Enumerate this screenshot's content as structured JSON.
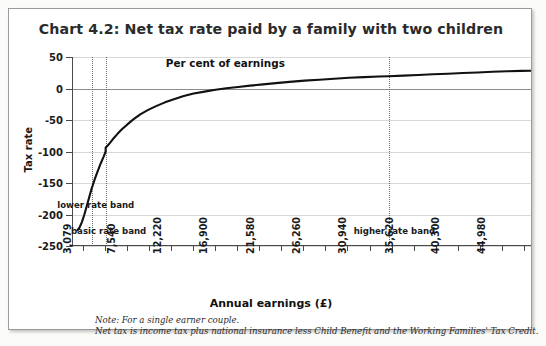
{
  "chart_title": "Chart 4.2: Net tax rate paid by a family with two children",
  "notes": [
    "Note: For a single earner couple.",
    "Net tax is income tax plus national insurance less Child Benefit and the Working Families' Tax Credit."
  ],
  "colors": {
    "line": "#111111",
    "grid": "#d8d8d8",
    "zero_line": "#8c8c8c",
    "axis": "#4a4a4a",
    "band_line": "#6d6d6d",
    "title": "#2b2b2b",
    "card_background": "#ffffff",
    "page_background": "#fbfbfa",
    "border": "#9a9a9a"
  },
  "annotations": [
    {
      "name": "series-label",
      "text": "Per cent of earnings",
      "x": 17500,
      "y": 40
    },
    {
      "name": "lower-rate-band",
      "text": "lower rate band",
      "x": 4400,
      "y": -185
    },
    {
      "name": "basic-rate-band",
      "text": "basic rate band",
      "x": 5700,
      "y": -226
    },
    {
      "name": "higher-rate-band",
      "text": "higher rate band",
      "x": 34600,
      "y": -226
    }
  ],
  "band_lines": [
    {
      "name": "lower-rate-band-line",
      "x": 4070
    },
    {
      "name": "basic-rate-band-line",
      "x": 5400
    },
    {
      "name": "higher-rate-band-line",
      "x": 34000
    }
  ],
  "chart_data": {
    "type": "line",
    "title": "Chart 4.2: Net tax rate paid by a family with two children",
    "xlabel": "Annual earnings (£)",
    "ylabel": "Tax rate",
    "xlim": [
      2000,
      48400
    ],
    "ylim": [
      -250,
      50
    ],
    "grid": true,
    "legend": "none",
    "series_name": "Per cent of earnings",
    "ytick_labels": [
      "50",
      "0",
      "-50",
      "-100",
      "-150",
      "-200",
      "-250"
    ],
    "yticks": [
      50,
      0,
      -50,
      -100,
      -150,
      -200,
      -250
    ],
    "xtick_labels": [
      "3,079",
      "7,540",
      "12,220",
      "16,900",
      "21,580",
      "26,260",
      "30,940",
      "35,620",
      "40,300",
      "44,980"
    ],
    "xticks": [
      3079,
      7540,
      12220,
      16900,
      21580,
      26260,
      30940,
      35620,
      40300,
      44980
    ],
    "x": [
      2550,
      2750,
      3000,
      3250,
      3500,
      3750,
      4000,
      4070,
      4300,
      4600,
      4900,
      5200,
      5400,
      5401,
      5700,
      6100,
      6600,
      7100,
      7600,
      8200,
      8900,
      9700,
      10500,
      11400,
      12300,
      13300,
      14300,
      15400,
      16500,
      17600,
      18800,
      20000,
      21300,
      22600,
      24000,
      25500,
      27000,
      28500,
      30000,
      31500,
      33000,
      34000,
      35500,
      37000,
      38500,
      40000,
      41500,
      43000,
      44500,
      46000,
      47400,
      48400
    ],
    "y": [
      -225,
      -221,
      -212,
      -200,
      -186,
      -172,
      -158,
      -155,
      -144,
      -131,
      -119,
      -108,
      -100,
      -94,
      -89,
      -81,
      -72,
      -64,
      -57,
      -49,
      -41,
      -34,
      -28,
      -22,
      -17,
      -12,
      -8,
      -5,
      -2,
      0.5,
      2.5,
      4.5,
      6.5,
      8.5,
      10.5,
      12.5,
      14,
      15.5,
      17,
      18,
      19,
      19.5,
      20.5,
      21.5,
      22.5,
      23.5,
      24.5,
      25.5,
      26.5,
      27.3,
      27.9,
      28.2
    ]
  }
}
